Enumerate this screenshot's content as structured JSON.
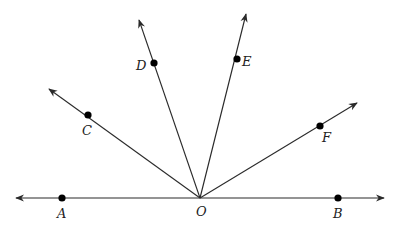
{
  "diagram": {
    "colors": {
      "stroke": "#2a2a2a",
      "point": "#000000",
      "label": "#222222",
      "background": "#ffffff"
    },
    "vertex": {
      "name": "O",
      "label": "O",
      "x": 200,
      "y": 198,
      "label_x": 196,
      "label_y": 216
    },
    "line": {
      "name": "line-AB",
      "left_tip": {
        "x": 16,
        "y": 198
      },
      "right_tip": {
        "x": 384,
        "y": 198
      }
    },
    "points": [
      {
        "name": "A",
        "label": "A",
        "x": 62,
        "y": 198,
        "label_x": 57,
        "label_y": 218
      },
      {
        "name": "B",
        "label": "B",
        "x": 338,
        "y": 198,
        "label_x": 333,
        "label_y": 218
      },
      {
        "name": "C",
        "label": "C",
        "x": 88,
        "y": 115,
        "label_x": 82,
        "label_y": 135
      },
      {
        "name": "D",
        "label": "D",
        "x": 154,
        "y": 63,
        "label_x": 136,
        "label_y": 70
      },
      {
        "name": "E",
        "label": "E",
        "x": 237,
        "y": 59,
        "label_x": 242,
        "label_y": 66
      },
      {
        "name": "F",
        "label": "F",
        "x": 320,
        "y": 126,
        "label_x": 322,
        "label_y": 142
      }
    ],
    "rays": [
      {
        "name": "ray-OA",
        "through": "A",
        "tip": {
          "x": 16,
          "y": 198
        }
      },
      {
        "name": "ray-OB",
        "through": "B",
        "tip": {
          "x": 384,
          "y": 198
        }
      },
      {
        "name": "ray-OC",
        "through": "C",
        "tip": {
          "x": 49,
          "y": 89
        }
      },
      {
        "name": "ray-OD",
        "through": "D",
        "tip": {
          "x": 139,
          "y": 20
        }
      },
      {
        "name": "ray-OE",
        "through": "E",
        "tip": {
          "x": 246,
          "y": 14
        }
      },
      {
        "name": "ray-OF",
        "through": "F",
        "tip": {
          "x": 357,
          "y": 103
        }
      }
    ]
  }
}
